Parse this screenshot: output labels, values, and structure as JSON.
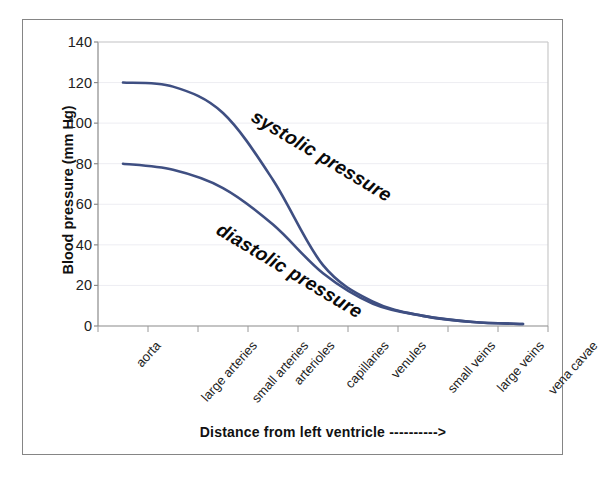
{
  "chart_data": {
    "type": "line",
    "title": "",
    "xlabel": "Distance from left ventricle ---------->",
    "ylabel": "Blood pressure (mm Hg)",
    "categories": [
      "aorta",
      "large arteries",
      "small arteries",
      "arterioles",
      "capillaries",
      "venules",
      "small veins",
      "large veins",
      "vena cavae"
    ],
    "ylim": [
      0,
      140
    ],
    "yticks": [
      0,
      20,
      40,
      60,
      80,
      100,
      120,
      140
    ],
    "ytick_labels": [
      "0",
      "20",
      "40",
      "60",
      "80",
      "100",
      "120",
      "140"
    ],
    "grid": "horizontal-faint",
    "legend_position": "inline-annotations",
    "series": [
      {
        "name": "systolic pressure",
        "color": "#3f4f82",
        "values": [
          120,
          118,
          105,
          72,
          30,
          12,
          5,
          2,
          1
        ]
      },
      {
        "name": "diastolic pressure",
        "color": "#3f4f82",
        "values": [
          80,
          77,
          68,
          50,
          26,
          11,
          5,
          2,
          1
        ]
      }
    ],
    "annotations": [
      {
        "text": "systolic pressure",
        "rotation_deg": 31
      },
      {
        "text": "diastolic pressure",
        "rotation_deg": 31
      }
    ]
  },
  "axis": {
    "y_title": "Blood pressure (mm Hg)",
    "x_title": "Distance from left ventricle ---------->",
    "y_ticks": [
      "140",
      "120",
      "100",
      "80",
      "60",
      "40",
      "20",
      "0"
    ],
    "x_ticks": [
      "aorta",
      "large arteries",
      "small arteries",
      "arterioles",
      "capillaries",
      "venules",
      "small veins",
      "large veins",
      "vena cavae"
    ]
  },
  "labels": {
    "systolic": "systolic pressure",
    "diastolic": "diastolic pressure"
  },
  "colors": {
    "curve": "#3f4f82",
    "axis": "#8a8a8a",
    "grid": "#ededf2",
    "frame": "#858585",
    "text": "#1c1c1c"
  }
}
